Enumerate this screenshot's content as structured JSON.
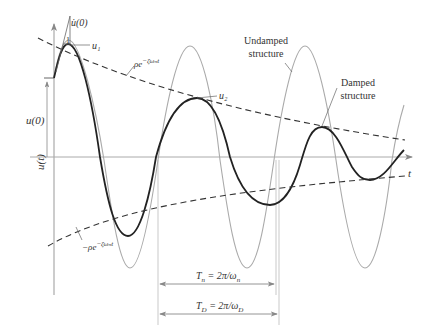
{
  "diagram": {
    "y_axis_label": "u(t)",
    "x_axis_label": "t",
    "initial_displacement_label": "u(0)",
    "initial_velocity_label": "u̇(0)",
    "slope_marker": "1",
    "peak_labels": [
      "u₁",
      "u₂"
    ],
    "upper_envelope_label": "ρe⁻ᶠωⁿᵗ",
    "upper_envelope_text": "ρe",
    "upper_envelope_exp": "−ζωₙt",
    "lower_envelope_text": "−ρe",
    "lower_envelope_exp": "−ζωₙt",
    "undamped_label_line1": "Undamped",
    "undamped_label_line2": "structure",
    "damped_label_line1": "Damped",
    "damped_label_line2": "structure",
    "period_natural": {
      "symbol": "T",
      "sub": "n",
      "eq": " = 2π/ω",
      "eq_sub": "n"
    },
    "period_damped": {
      "symbol": "T",
      "sub": "D",
      "eq": " = 2π/ω",
      "eq_sub": "D"
    },
    "colors": {
      "damped_curve": "#222222",
      "undamped_curve": "#aaaaaa",
      "envelope": "#333333",
      "axis": "#999999"
    }
  }
}
